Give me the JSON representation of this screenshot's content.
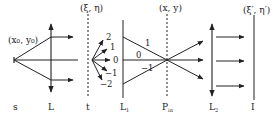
{
  "diagram": {
    "type": "optical-setup",
    "colors": {
      "line": "#222222",
      "background": "#ffffff"
    },
    "planes": [
      {
        "id": "s",
        "label": "s",
        "coord_label": "(x0, y0)"
      },
      {
        "id": "L",
        "label": "L"
      },
      {
        "id": "t",
        "label": "t",
        "coord_label": "(ξ, η)"
      },
      {
        "id": "L1",
        "label": "L1"
      },
      {
        "id": "Pin",
        "label": "Pin",
        "coord_label": "(x, y)"
      },
      {
        "id": "L2",
        "label": "L2"
      },
      {
        "id": "I",
        "label": "I",
        "coord_label": "(ξ', η')"
      }
    ],
    "labels": {
      "source_coord": "(x₀, y₀)",
      "grating_coord": "(ξ, η)",
      "input_coord": "(x, y)",
      "image_coord": "(ξ′, η′)",
      "s": "s",
      "L": "L",
      "t": "t",
      "L1_main": "L",
      "L1_sub": "1",
      "Pin_main": "P",
      "Pin_sub": "in",
      "L2_main": "L",
      "L2_sub": "2",
      "I": "I"
    },
    "diffraction_orders": [
      "2",
      "1",
      "0",
      "−1",
      "−2"
    ],
    "converging_orders": [
      "1",
      "0",
      "−1"
    ]
  }
}
